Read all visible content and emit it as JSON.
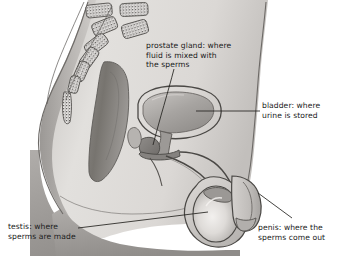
{
  "figure": {
    "background_color": "#ffffff",
    "ink_color": "#1a1a1a",
    "width": 339,
    "height": 256
  },
  "labels": [
    {
      "id": "prostate",
      "name": "prostate gland",
      "lines": [
        "prostate gland: where",
        "fluid is mixed with",
        "the sperms"
      ],
      "text": "prostate gland: where\nfluid is mixed with\nthe sperms"
    },
    {
      "id": "bladder",
      "name": "bladder",
      "lines": [
        "bladder: where",
        "urine is stored"
      ],
      "text": "bladder: where\nurine is stored"
    },
    {
      "id": "testis",
      "name": "testis",
      "lines": [
        "testis: where",
        "sperms are made"
      ],
      "text": "testis: where\nsperms are made"
    },
    {
      "id": "penis",
      "name": "penis",
      "lines": [
        "penis: where the",
        "sperms come out"
      ],
      "text": "penis: where the\nsperms come out"
    }
  ],
  "anatomy": {
    "parts": [
      "spine-vertebrae",
      "sacrum",
      "rectum",
      "bladder",
      "prostate-gland",
      "urethra",
      "vas-deferens",
      "testis",
      "scrotum",
      "penis",
      "abdominal-wall",
      "buttock"
    ]
  },
  "palette": {
    "body_light": "#e6e4e2",
    "body_mid": "#cfccc9",
    "body_shadow": "#a8a5a2",
    "organ_dark": "#8e8b88",
    "organ_mid": "#b9b6b3",
    "organ_light": "#dedbd8",
    "outline": "#4a4845",
    "line": "#2b2a28"
  }
}
